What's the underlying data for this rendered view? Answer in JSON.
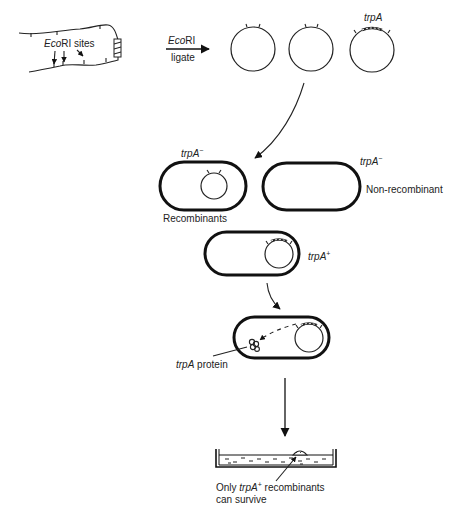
{
  "figure": {
    "type": "cloning-selection-diagram",
    "labels": {
      "ecori_sites": "EcoRI sites",
      "ecori_sites_italic": "Eco",
      "ecori_sites_rest": "RI sites",
      "digest_enzyme_italic": "Eco",
      "digest_enzyme_rest": "RI",
      "ligate": "ligate",
      "plasmid_gene": "trpA",
      "recombinant_genotype_italic": "trpA",
      "recombinant_genotype_sup": "−",
      "nonrecombinant_genotype_italic": "trpA",
      "nonrecombinant_genotype_sup": "−",
      "recombinants": "Recombinants",
      "non_recombinant": "Non-recombinant",
      "positive_genotype_italic": "trpA",
      "positive_genotype_sup": "+",
      "protein_italic": "trpA",
      "protein_rest": " protein",
      "survivors_line1_pre": "Only ",
      "survivors_line1_italic": "trpA",
      "survivors_line1_sup": "+",
      "survivors_line1_post": " recombinants",
      "survivors_line2": "can survive"
    },
    "steps": [
      "Genomic DNA with EcoRI sites",
      "Digest with EcoRI and ligate into plasmids",
      "Transform into trpA− cells",
      "Recombinants vs non-recombinant",
      "trpA+ cell expresses trpA protein",
      "Plate selection: only trpA+ recombinants survive"
    ]
  }
}
